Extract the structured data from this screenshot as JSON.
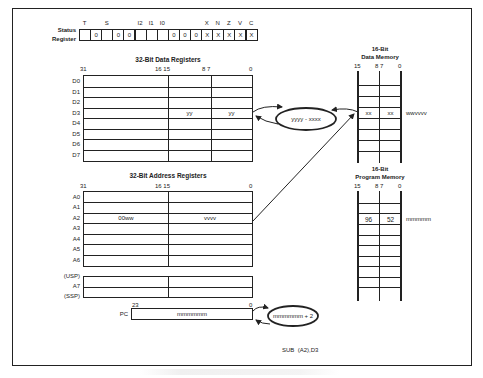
{
  "status_register": {
    "label_line1": "Status",
    "label_line2": "Register",
    "bit_labels": [
      {
        "text": "T",
        "cell": 0
      },
      {
        "text": "S",
        "cell": 2
      },
      {
        "text": "I2",
        "cell": 5
      },
      {
        "text": "I1",
        "cell": 6
      },
      {
        "text": "I0",
        "cell": 7
      },
      {
        "text": "X",
        "cell": 11
      },
      {
        "text": "N",
        "cell": 12
      },
      {
        "text": "Z",
        "cell": 13
      },
      {
        "text": "V",
        "cell": 14
      },
      {
        "text": "C",
        "cell": 15
      }
    ],
    "cells": [
      "",
      "0",
      "",
      "0",
      "0",
      "",
      "",
      "",
      "0",
      "0",
      "0",
      "X",
      "X",
      "X",
      "X",
      "X"
    ]
  },
  "data_registers": {
    "title": "32-Bit Data Registers",
    "bit_marks": {
      "b31": "31",
      "b16_15": "16 15",
      "b8_7": "8 7",
      "b0": "0"
    },
    "rows": [
      {
        "name": "D0",
        "hi": "",
        "mid": "",
        "lo": ""
      },
      {
        "name": "D1",
        "hi": "",
        "mid": "",
        "lo": ""
      },
      {
        "name": "D2",
        "hi": "",
        "mid": "",
        "lo": ""
      },
      {
        "name": "D3",
        "hi": "",
        "mid": "yy",
        "lo": "yy"
      },
      {
        "name": "D4",
        "hi": "",
        "mid": "",
        "lo": ""
      },
      {
        "name": "D5",
        "hi": "",
        "mid": "",
        "lo": ""
      },
      {
        "name": "D6",
        "hi": "",
        "mid": "",
        "lo": ""
      },
      {
        "name": "D7",
        "hi": "",
        "mid": "",
        "lo": ""
      }
    ]
  },
  "address_registers": {
    "title": "32-Bit Address Registers",
    "bit_marks": {
      "b31": "31",
      "b16_15": "16 15",
      "b0": "0"
    },
    "rows": [
      {
        "name": "A0",
        "hi": "",
        "lo": ""
      },
      {
        "name": "A1",
        "hi": "",
        "lo": ""
      },
      {
        "name": "A2",
        "hi": "00ww",
        "lo": "vvvv"
      },
      {
        "name": "A3",
        "hi": "",
        "lo": ""
      },
      {
        "name": "A4",
        "hi": "",
        "lo": ""
      },
      {
        "name": "A5",
        "hi": "",
        "lo": ""
      },
      {
        "name": "A6",
        "hi": "",
        "lo": ""
      }
    ],
    "stack_labels": {
      "usp": "(USP)",
      "a7": "A7",
      "ssp": "(SSP)"
    }
  },
  "program_counter": {
    "label": "PC",
    "bit_hi": "23",
    "bit_lo": "0",
    "value": "mmmmmm",
    "increment_bubble": "mmmmmm + 2"
  },
  "alu_bubble": {
    "text": "yyyy - xxxx"
  },
  "data_memory": {
    "title_line1": "16-Bit",
    "title_line2": "Data Memory",
    "bit_marks": {
      "b15": "15",
      "b8_7": "8 7",
      "b0": "0"
    },
    "highlight_row": {
      "hi": "xx",
      "lo": "xx",
      "address": "wwvvvv"
    }
  },
  "program_memory": {
    "title_line1": "16-Bit",
    "title_line2": "Program Memory",
    "bit_marks": {
      "b15": "15",
      "b8_7": "8 7",
      "b0": "0"
    },
    "highlight_row": {
      "hi": "96",
      "lo": "52",
      "address": "mmmmm"
    }
  },
  "instruction": {
    "text": "SUB  (A2),D3"
  }
}
